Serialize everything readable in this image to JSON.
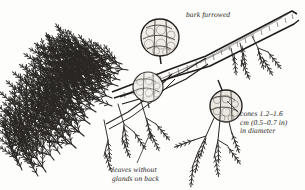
{
  "figure": {
    "kind": "botanical-line-illustration",
    "background_color": "#fdfdfc",
    "ink_color": "#1c1a18"
  },
  "annotations": {
    "bark": {
      "name": "bark-furrowed-label",
      "text": "bark furrowed"
    },
    "cones": {
      "name": "cone-size-label",
      "line1": "cones 1.2–1.6",
      "line2": "cm (0.5–0.7 in)",
      "line3": "in diameter"
    },
    "leaves": {
      "name": "leaves-glands-label",
      "line1": "leaves without",
      "line2": "glands on back"
    }
  },
  "specimen": {
    "cones": [
      {
        "name": "cone-upper",
        "cx": 160,
        "cy": 38,
        "r": 19
      },
      {
        "name": "cone-middle",
        "cx": 148,
        "cy": 87,
        "r": 15
      },
      {
        "name": "cone-lower-right",
        "cx": 226,
        "cy": 106,
        "r": 16
      }
    ],
    "main_branch": {
      "name": "main-branch",
      "description": "furrowed woody stem running from lower-left foliage mass up to the upper-right corner"
    },
    "foliage": {
      "name": "foliage-mass",
      "description": "dense flattened sprays of scale-like leaves filling the lower-left half"
    }
  }
}
